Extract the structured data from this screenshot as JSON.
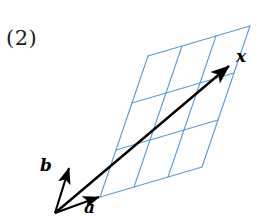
{
  "figure": {
    "item_label": "(2)",
    "grid": {
      "rows": 3,
      "cols": 3,
      "color": "#5b9bd5",
      "line_width": 1.1,
      "origin_corner": [
        100,
        197
      ],
      "col_step": [
        34.0,
        -10.0
      ],
      "row_step": [
        16.0,
        -47.0
      ]
    },
    "vectors": [
      {
        "name": "a",
        "label": "a",
        "color": "#000000",
        "start": [
          55,
          213
        ],
        "end": [
          99,
          197
        ],
        "label_pos": [
          84,
          199
        ]
      },
      {
        "name": "b",
        "label": "b",
        "color": "#000000",
        "start": [
          55,
          213
        ],
        "end": [
          69,
          168
        ],
        "label_pos": [
          40,
          157
        ]
      },
      {
        "name": "x",
        "label": "x",
        "color": "#000000",
        "start": [
          55,
          213
        ],
        "end": [
          229,
          66
        ],
        "label_pos": [
          236,
          48
        ]
      }
    ]
  }
}
